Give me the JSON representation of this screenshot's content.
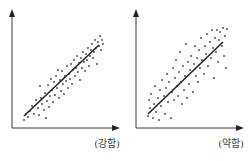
{
  "chart_data": [
    {
      "type": "scatter",
      "title": "",
      "label": "(강함)",
      "xlabel": "",
      "ylabel": "",
      "xlim": [
        0,
        1
      ],
      "ylim": [
        0,
        1
      ],
      "grid": false,
      "trendline": {
        "x": [
          0.1,
          0.85
        ],
        "y": [
          0.1,
          0.81
        ]
      },
      "points": [
        [
          0.1,
          0.06
        ],
        [
          0.12,
          0.12
        ],
        [
          0.14,
          0.09
        ],
        [
          0.16,
          0.15
        ],
        [
          0.18,
          0.2
        ],
        [
          0.2,
          0.12
        ],
        [
          0.22,
          0.26
        ],
        [
          0.24,
          0.18
        ],
        [
          0.25,
          0.11
        ],
        [
          0.27,
          0.28
        ],
        [
          0.28,
          0.22
        ],
        [
          0.3,
          0.16
        ],
        [
          0.31,
          0.33
        ],
        [
          0.33,
          0.25
        ],
        [
          0.34,
          0.41
        ],
        [
          0.35,
          0.19
        ],
        [
          0.36,
          0.3
        ],
        [
          0.38,
          0.36
        ],
        [
          0.39,
          0.24
        ],
        [
          0.4,
          0.44
        ],
        [
          0.41,
          0.31
        ],
        [
          0.42,
          0.5
        ],
        [
          0.43,
          0.38
        ],
        [
          0.45,
          0.28
        ],
        [
          0.46,
          0.46
        ],
        [
          0.47,
          0.35
        ],
        [
          0.48,
          0.55
        ],
        [
          0.49,
          0.42
        ],
        [
          0.5,
          0.32
        ],
        [
          0.51,
          0.5
        ],
        [
          0.52,
          0.45
        ],
        [
          0.53,
          0.6
        ],
        [
          0.54,
          0.38
        ],
        [
          0.55,
          0.52
        ],
        [
          0.56,
          0.47
        ],
        [
          0.57,
          0.62
        ],
        [
          0.58,
          0.42
        ],
        [
          0.59,
          0.56
        ],
        [
          0.6,
          0.66
        ],
        [
          0.61,
          0.5
        ],
        [
          0.62,
          0.58
        ],
        [
          0.63,
          0.7
        ],
        [
          0.64,
          0.54
        ],
        [
          0.65,
          0.63
        ],
        [
          0.66,
          0.46
        ],
        [
          0.67,
          0.68
        ],
        [
          0.68,
          0.58
        ],
        [
          0.69,
          0.74
        ],
        [
          0.7,
          0.64
        ],
        [
          0.71,
          0.55
        ],
        [
          0.72,
          0.72
        ],
        [
          0.73,
          0.66
        ],
        [
          0.74,
          0.78
        ],
        [
          0.75,
          0.6
        ],
        [
          0.76,
          0.7
        ],
        [
          0.77,
          0.76
        ],
        [
          0.78,
          0.82
        ],
        [
          0.79,
          0.68
        ],
        [
          0.8,
          0.74
        ],
        [
          0.81,
          0.86
        ],
        [
          0.82,
          0.78
        ],
        [
          0.83,
          0.62
        ],
        [
          0.84,
          0.84
        ],
        [
          0.85,
          0.8
        ],
        [
          0.86,
          0.9
        ],
        [
          0.87,
          0.76
        ],
        [
          0.88,
          0.86
        ],
        [
          0.89,
          0.82
        ],
        [
          0.26,
          0.4
        ],
        [
          0.32,
          0.08
        ],
        [
          0.44,
          0.56
        ],
        [
          0.37,
          0.47
        ]
      ]
    },
    {
      "type": "scatter",
      "title": "",
      "label": "(약함)",
      "xlabel": "",
      "ylabel": "",
      "xlim": [
        0,
        1
      ],
      "ylim": [
        0,
        1
      ],
      "grid": false,
      "trendline": {
        "x": [
          0.1,
          0.85
        ],
        "y": [
          0.12,
          0.84
        ]
      },
      "points": [
        [
          0.1,
          0.1
        ],
        [
          0.11,
          0.26
        ],
        [
          0.12,
          0.18
        ],
        [
          0.13,
          0.32
        ],
        [
          0.15,
          0.08
        ],
        [
          0.16,
          0.22
        ],
        [
          0.17,
          0.4
        ],
        [
          0.18,
          0.14
        ],
        [
          0.2,
          0.28
        ],
        [
          0.21,
          0.06
        ],
        [
          0.22,
          0.36
        ],
        [
          0.23,
          0.2
        ],
        [
          0.24,
          0.46
        ],
        [
          0.26,
          0.3
        ],
        [
          0.27,
          0.12
        ],
        [
          0.28,
          0.38
        ],
        [
          0.29,
          0.52
        ],
        [
          0.3,
          0.24
        ],
        [
          0.31,
          0.44
        ],
        [
          0.33,
          0.08
        ],
        [
          0.34,
          0.34
        ],
        [
          0.35,
          0.58
        ],
        [
          0.36,
          0.26
        ],
        [
          0.37,
          0.48
        ],
        [
          0.38,
          0.66
        ],
        [
          0.39,
          0.4
        ],
        [
          0.4,
          0.3
        ],
        [
          0.41,
          0.54
        ],
        [
          0.42,
          0.74
        ],
        [
          0.43,
          0.44
        ],
        [
          0.44,
          0.22
        ],
        [
          0.45,
          0.6
        ],
        [
          0.46,
          0.36
        ],
        [
          0.47,
          0.5
        ],
        [
          0.48,
          0.82
        ],
        [
          0.49,
          0.28
        ],
        [
          0.5,
          0.64
        ],
        [
          0.51,
          0.42
        ],
        [
          0.52,
          0.56
        ],
        [
          0.53,
          0.7
        ],
        [
          0.55,
          0.34
        ],
        [
          0.56,
          0.62
        ],
        [
          0.57,
          0.8
        ],
        [
          0.58,
          0.5
        ],
        [
          0.59,
          0.68
        ],
        [
          0.6,
          0.44
        ],
        [
          0.61,
          0.76
        ],
        [
          0.62,
          0.58
        ],
        [
          0.63,
          0.88
        ],
        [
          0.64,
          0.66
        ],
        [
          0.66,
          0.52
        ],
        [
          0.67,
          0.8
        ],
        [
          0.68,
          0.72
        ],
        [
          0.69,
          0.92
        ],
        [
          0.7,
          0.6
        ],
        [
          0.72,
          0.84
        ],
        [
          0.73,
          0.68
        ],
        [
          0.74,
          0.96
        ],
        [
          0.75,
          0.78
        ],
        [
          0.76,
          0.48
        ],
        [
          0.77,
          0.88
        ],
        [
          0.78,
          0.74
        ],
        [
          0.79,
          0.96
        ],
        [
          0.8,
          0.64
        ],
        [
          0.81,
          0.86
        ],
        [
          0.82,
          0.94
        ],
        [
          0.84,
          0.8
        ],
        [
          0.85,
          0.98
        ],
        [
          0.86,
          0.7
        ],
        [
          0.87,
          0.9
        ],
        [
          0.88,
          0.58
        ],
        [
          0.89,
          0.97
        ]
      ]
    }
  ]
}
